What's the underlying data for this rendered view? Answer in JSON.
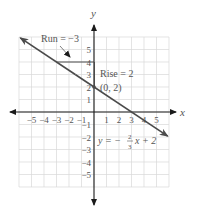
{
  "chart_data": {
    "type": "line",
    "title": "",
    "xlabel": "x",
    "ylabel": "y",
    "xlim": [
      -6,
      6
    ],
    "ylim": [
      -6,
      6
    ],
    "grid": true,
    "x_ticks": [
      -5,
      -4,
      -3,
      -2,
      -1,
      1,
      2,
      3,
      4,
      5
    ],
    "y_ticks": [
      -5,
      -4,
      -3,
      -2,
      -1,
      1,
      2,
      3,
      4,
      5
    ],
    "series": [
      {
        "name": "y = -2/3 x + 2",
        "slope": -0.6667,
        "intercept": 2,
        "x": [
          -6,
          -3,
          0,
          3,
          6
        ],
        "y": [
          6,
          4,
          2,
          0,
          -2
        ]
      }
    ],
    "annotations": [
      {
        "text": "Run = −3",
        "description": "horizontal segment from (0,4) to (-3,4)"
      },
      {
        "text": "Rise = 2",
        "description": "vertical segment from (0,2) to (0,4)"
      },
      {
        "text": "(0, 2)",
        "description": "y-intercept point"
      },
      {
        "text": "y = −⅔x + 2",
        "description": "line equation label"
      }
    ]
  },
  "labels": {
    "x_axis": "x",
    "y_axis": "y",
    "run": "Run = −3",
    "rise": "Rise = 2",
    "point": "(0, 2)",
    "eq_left": "y = −",
    "eq_num": "2",
    "eq_den": "3",
    "eq_right": "x + 2"
  },
  "colors": {
    "line": "#4a4a4a",
    "axis": "#1a1a1a",
    "grid": "#d8d8d8",
    "text": "#555555"
  }
}
